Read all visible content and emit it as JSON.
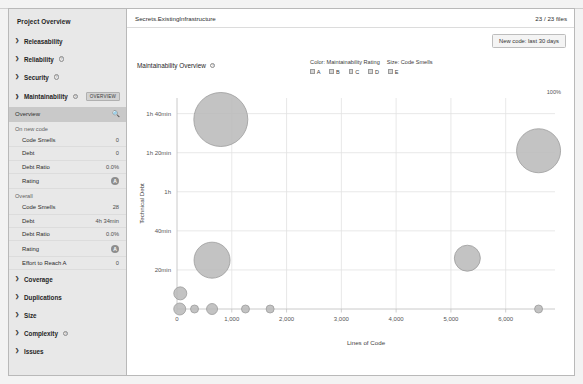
{
  "sidebar": {
    "title": "Project Overview",
    "groups": [
      {
        "label": "Releasability",
        "has_help": false
      },
      {
        "label": "Reliability",
        "has_help": true
      },
      {
        "label": "Security",
        "has_help": true
      },
      {
        "label": "Maintainability",
        "has_help": true,
        "badge": "OVERVIEW"
      }
    ],
    "sub_item": {
      "label": "Overview",
      "icon": "magnifier-icon"
    },
    "section_new_code": "On new code",
    "new_code_metrics": [
      {
        "label": "Code Smells",
        "value": "0"
      },
      {
        "label": "Debt",
        "value": "0"
      },
      {
        "label": "Debt Ratio",
        "value": "0.0%"
      },
      {
        "label": "Rating",
        "value": "A",
        "is_rating": true
      }
    ],
    "section_overall": "Overall",
    "overall_metrics": [
      {
        "label": "Code Smells",
        "value": "28"
      },
      {
        "label": "Debt",
        "value": "4h 34min"
      },
      {
        "label": "Debt Ratio",
        "value": "0.0%"
      },
      {
        "label": "Rating",
        "value": "A",
        "is_rating": true
      },
      {
        "label": "Effort to Reach A",
        "value": "0"
      }
    ],
    "bottom_groups": [
      {
        "label": "Coverage",
        "has_help": false
      },
      {
        "label": "Duplications",
        "has_help": false
      },
      {
        "label": "Size",
        "has_help": false
      },
      {
        "label": "Complexity",
        "has_help": true
      },
      {
        "label": "Issues",
        "has_help": false
      }
    ]
  },
  "header": {
    "breadcrumb": "Secrets.ExistingInfrastructure",
    "file_count": "23 / 23 files",
    "new_code_button": "New code: last 30 days"
  },
  "chart_data": {
    "type": "scatter",
    "title": "Maintainability Overview",
    "xlabel": "Lines of Code",
    "ylabel": "Technical Debt",
    "color_legend_title": "Color: Maintainability Rating",
    "size_legend_title": "Size: Code Smells",
    "legend_entries": [
      "A",
      "B",
      "C",
      "D",
      "E"
    ],
    "corner_label": "100%",
    "xlim": [
      0,
      6900
    ],
    "ylim": [
      0,
      108
    ],
    "xticks": [
      0,
      1000,
      2000,
      3000,
      4000,
      5000,
      6000
    ],
    "xticklabels": [
      "0",
      "1,000",
      "2,000",
      "3,000",
      "4,000",
      "5,000",
      "6,000"
    ],
    "yticks": [
      20,
      40,
      60,
      80,
      100
    ],
    "yticklabels": [
      "20min",
      "40min",
      "1h",
      "1h 20min",
      "1h 40min"
    ],
    "grid": true,
    "points": [
      {
        "x": 800,
        "y": 97,
        "size": 27,
        "rating": "A"
      },
      {
        "x": 6600,
        "y": 81,
        "size": 22,
        "rating": "A"
      },
      {
        "x": 640,
        "y": 25,
        "size": 18,
        "rating": "A"
      },
      {
        "x": 5300,
        "y": 26,
        "size": 13,
        "rating": "A"
      },
      {
        "x": 60,
        "y": 8,
        "size": 6.5,
        "rating": "A"
      },
      {
        "x": 50,
        "y": 0,
        "size": 6,
        "rating": "A"
      },
      {
        "x": 320,
        "y": 0,
        "size": 4,
        "rating": "A"
      },
      {
        "x": 640,
        "y": 0,
        "size": 5.5,
        "rating": "A"
      },
      {
        "x": 1250,
        "y": 0,
        "size": 4,
        "rating": "A"
      },
      {
        "x": 1700,
        "y": 0,
        "size": 4,
        "rating": "A"
      },
      {
        "x": 6600,
        "y": 0,
        "size": 4,
        "rating": "A"
      }
    ]
  },
  "colors": {
    "bubble_fill": "#b9b9b9",
    "bubble_stroke": "#9c9c9c",
    "grid": "#e2e2e2",
    "axis": "#c4c4c4",
    "sidebar_bg": "#e8e8e8",
    "sub_active_bg": "#c9c9c9"
  }
}
